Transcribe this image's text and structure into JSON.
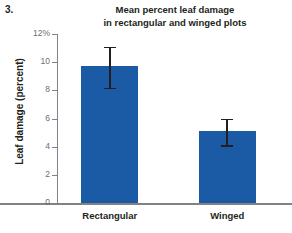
{
  "figure": {
    "number": "3."
  },
  "chart_data": {
    "type": "bar",
    "title": "Mean percent leaf damage in rectangular and winged plots",
    "title_lines": [
      "Mean percent leaf damage",
      "in rectangular and winged plots"
    ],
    "xlabel": "",
    "ylabel": "Leaf damage (percent)",
    "categories": [
      "Rectangular",
      "Winged"
    ],
    "values": [
      9.7,
      5.1
    ],
    "errors_upper": [
      11.1,
      6.0
    ],
    "errors_lower": [
      8.2,
      4.1
    ],
    "ylim": [
      0,
      12
    ],
    "yticks": [
      0,
      2,
      4,
      6,
      8,
      10,
      12
    ],
    "ytick_labels": [
      "0",
      "2",
      "4",
      "6",
      "8",
      "10",
      "12%"
    ],
    "grid": false,
    "legend": false,
    "bar_color": "#1b5ba5",
    "axis_color": "#808285",
    "text_color": "#231f20",
    "tick_label_color": "#6d6e71"
  }
}
